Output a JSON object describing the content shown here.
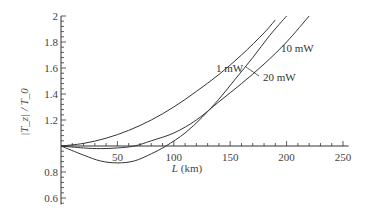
{
  "chart_data": {
    "type": "line",
    "title": "",
    "xlabel": "L (km)",
    "ylabel": "|T_z| / T_0",
    "xlim": [
      0,
      255
    ],
    "ylim": [
      0.55,
      2.0
    ],
    "x_ticks": [
      50,
      100,
      150,
      200,
      250
    ],
    "y_ticks": [
      0.6,
      0.8,
      1.2,
      1.4,
      1.6,
      1.8,
      2
    ],
    "x_tick_labels": [
      "50",
      "100",
      "150",
      "200",
      "250"
    ],
    "y_tick_labels": [
      "0.6",
      "0.8",
      "1.2",
      "1.4",
      "1.6",
      "1.8",
      "2"
    ],
    "axis_crossing": {
      "x": 0,
      "y": 1
    },
    "grid": false,
    "legend": "inline labels",
    "series": [
      {
        "name": "1 mW",
        "x": [
          0,
          20,
          40,
          60,
          80,
          100,
          120,
          140,
          160,
          180,
          190
        ],
        "y": [
          1.0,
          1.02,
          1.06,
          1.12,
          1.2,
          1.3,
          1.42,
          1.55,
          1.7,
          1.87,
          1.97
        ]
      },
      {
        "name": "10 mW",
        "x": [
          0,
          20,
          35,
          50,
          65,
          80,
          100,
          120,
          140,
          160,
          180,
          200,
          220
        ],
        "y": [
          1.0,
          0.985,
          0.98,
          0.985,
          1.0,
          1.04,
          1.1,
          1.2,
          1.34,
          1.48,
          1.63,
          1.8,
          2.0
        ]
      },
      {
        "name": "20 mW",
        "x": [
          0,
          20,
          35,
          50,
          65,
          80,
          93,
          110,
          125,
          140,
          155,
          170,
          185,
          200
        ],
        "y": [
          1.0,
          0.93,
          0.885,
          0.87,
          0.885,
          0.94,
          1.0,
          1.1,
          1.22,
          1.36,
          1.52,
          1.68,
          1.85,
          2.0
        ]
      }
    ],
    "annotations": [
      {
        "text": "1 mW",
        "x": 148,
        "y": 1.7
      },
      {
        "text": "10 mW",
        "x": 200,
        "y": 1.84
      },
      {
        "text": "20 mW",
        "x": 176,
        "y": 1.53
      }
    ]
  },
  "labels": {
    "xlabel_main": "L",
    "xlabel_unit": " (km)",
    "ylabel": "|T_z| / T_0",
    "series_1mW": "1 mW",
    "series_10mW": "10 mW",
    "series_20mW": "20 mW"
  }
}
